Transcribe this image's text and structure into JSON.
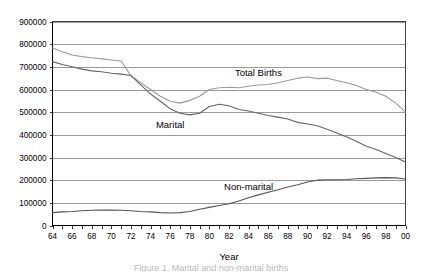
{
  "chart_data": {
    "type": "line",
    "title": "",
    "xlabel": "Year",
    "ylabel": "",
    "xlim": [
      64,
      100
    ],
    "ylim": [
      0,
      900000
    ],
    "grid": true,
    "legend_position": "inline-annotations",
    "x": [
      64,
      65,
      66,
      67,
      68,
      69,
      70,
      71,
      72,
      73,
      74,
      75,
      76,
      77,
      78,
      79,
      80,
      81,
      82,
      83,
      84,
      85,
      86,
      87,
      88,
      89,
      90,
      91,
      92,
      93,
      94,
      95,
      96,
      97,
      98,
      99,
      100
    ],
    "x_tick_labels": [
      "64",
      "66",
      "68",
      "70",
      "72",
      "74",
      "76",
      "78",
      "80",
      "82",
      "84",
      "86",
      "88",
      "90",
      "92",
      "94",
      "96",
      "98",
      "00"
    ],
    "y_tick_labels": [
      "0",
      "100000",
      "200000",
      "300000",
      "400000",
      "500000",
      "600000",
      "700000",
      "800000",
      "900000"
    ],
    "y_ticks": [
      0,
      100000,
      200000,
      300000,
      400000,
      500000,
      600000,
      700000,
      800000,
      900000
    ],
    "series": [
      {
        "name": "Total Births",
        "color": "#9a9a9a",
        "label_x": 85,
        "label_y": 660000,
        "values": [
          783000,
          767000,
          752000,
          745000,
          740000,
          735000,
          730000,
          726000,
          660000,
          630000,
          600000,
          570000,
          548000,
          540000,
          552000,
          570000,
          600000,
          608000,
          610000,
          608000,
          614000,
          620000,
          622000,
          630000,
          640000,
          650000,
          655000,
          648000,
          650000,
          640000,
          630000,
          618000,
          600000,
          588000,
          570000,
          540000,
          500000
        ]
      },
      {
        "name": "Marital",
        "color": "#666666",
        "label_x": 76,
        "label_y": 430000,
        "values": [
          723000,
          710000,
          700000,
          690000,
          682000,
          678000,
          672000,
          668000,
          662000,
          620000,
          580000,
          548000,
          515000,
          495000,
          488000,
          495000,
          525000,
          535000,
          528000,
          512000,
          505000,
          495000,
          485000,
          478000,
          470000,
          455000,
          448000,
          440000,
          425000,
          408000,
          390000,
          372000,
          350000,
          335000,
          318000,
          300000,
          280000
        ]
      },
      {
        "name": "Non-marital",
        "color": "#555555",
        "label_x": 84,
        "label_y": 155000,
        "values": [
          57000,
          60000,
          62000,
          65000,
          67000,
          68000,
          68000,
          67000,
          65000,
          62000,
          60000,
          57000,
          55000,
          57000,
          62000,
          72000,
          80000,
          88000,
          96000,
          108000,
          122000,
          135000,
          147000,
          158000,
          170000,
          180000,
          192000,
          200000,
          202000,
          202000,
          203000,
          206000,
          208000,
          210000,
          211000,
          210000,
          205000
        ]
      }
    ]
  },
  "axis": {
    "x_title": "Year"
  },
  "caption": {
    "text": "Figure 1. Marital and non-marital births"
  }
}
